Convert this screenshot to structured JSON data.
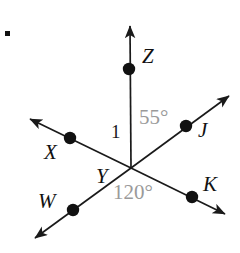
{
  "figure": {
    "canvas": {
      "width": 240,
      "height": 253,
      "background": "#ffffff"
    },
    "colors": {
      "line": "#1a1a1a",
      "point": "#111111",
      "label": "#111111",
      "angle_gray": "#9a9a9a"
    },
    "vertex": {
      "name": "Y",
      "x": 131,
      "y": 168
    },
    "bullet_marker": {
      "name": "item-bullet",
      "x": 5,
      "y": 31
    },
    "points": [
      {
        "id": "Z",
        "label": "Z",
        "dot_x": 129,
        "dot_y": 69,
        "label_x": 142,
        "label_y": 46
      },
      {
        "id": "J",
        "label": "J",
        "dot_x": 186,
        "dot_y": 126,
        "label_x": 198,
        "label_y": 120
      },
      {
        "id": "X",
        "label": "X",
        "dot_x": 70,
        "dot_y": 138,
        "label_x": 44,
        "label_y": 142
      },
      {
        "id": "W",
        "label": "W",
        "dot_x": 73,
        "dot_y": 210,
        "label_x": 38,
        "label_y": 191
      },
      {
        "id": "K",
        "label": "K",
        "dot_x": 192,
        "dot_y": 197,
        "label_x": 203,
        "label_y": 174
      }
    ],
    "rays": [
      {
        "id": "ray-YZ",
        "name": "ray-y-to-z",
        "x1": 131,
        "y1": 168,
        "x2": 130,
        "y2": 26,
        "arrow": true
      },
      {
        "id": "ray-YJ",
        "name": "ray-y-to-j",
        "x1": 131,
        "y1": 168,
        "x2": 229,
        "y2": 96,
        "arrow": true
      },
      {
        "id": "ray-YX",
        "name": "ray-y-to-x",
        "x1": 131,
        "y1": 168,
        "x2": 30,
        "y2": 119,
        "arrow": true
      },
      {
        "id": "ray-YW",
        "name": "ray-y-to-w",
        "x1": 131,
        "y1": 168,
        "x2": 35,
        "y2": 238,
        "arrow": true
      },
      {
        "id": "ray-YK",
        "name": "ray-y-to-k",
        "x1": 131,
        "y1": 168,
        "x2": 225,
        "y2": 214,
        "arrow": true
      }
    ],
    "angle_labels": [
      {
        "id": "angle-1",
        "text": "1",
        "x": 111,
        "y": 122,
        "style": "black"
      },
      {
        "id": "angle-55",
        "text": "55°",
        "x": 139,
        "y": 107,
        "style": "gray"
      },
      {
        "id": "angle-120",
        "text": "120°",
        "x": 113,
        "y": 182,
        "style": "gray"
      }
    ]
  },
  "chart_data": {
    "type": "diagram",
    "vertex": "Y",
    "rays_from_vertex": [
      "YZ",
      "YJ",
      "YX",
      "YW",
      "YK"
    ],
    "labeled_points": [
      "Z",
      "J",
      "X",
      "W",
      "K",
      "Y"
    ],
    "angle_measures": [
      {
        "label": "1",
        "value": null,
        "unit": "degrees",
        "between": [
          "YX",
          "YZ"
        ]
      },
      {
        "label": "55°",
        "value": 55,
        "unit": "degrees",
        "between": [
          "YZ",
          "YJ"
        ]
      },
      {
        "label": "120°",
        "value": 120,
        "unit": "degrees",
        "between": [
          "YW",
          "YK"
        ]
      }
    ],
    "collinear_sets": [
      [
        "X",
        "Y",
        "K"
      ],
      [
        "W",
        "Y",
        "J"
      ]
    ]
  }
}
